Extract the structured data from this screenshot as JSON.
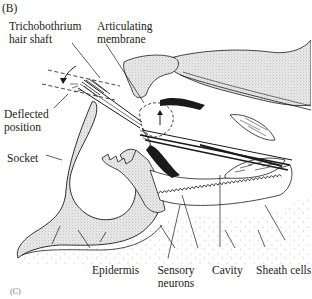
{
  "figure": {
    "panel_label": "(B)",
    "next_panel_label": "(C)",
    "labels": {
      "trichobothrium": [
        "Trichobothrium",
        "hair shaft"
      ],
      "articulating_membrane": [
        "Articulating",
        "membrane"
      ],
      "deflected_position": [
        "Deflected",
        "position"
      ],
      "socket": "Socket",
      "epidermis": "Epidermis",
      "sensory_neurons": [
        "Sensory",
        "neurons"
      ],
      "cavity": "Cavity",
      "sheath_cells": "Sheath cells"
    },
    "colors": {
      "ink": "#1a1a1a",
      "stipple": "#9a9a9a",
      "background": "#ffffff"
    }
  }
}
